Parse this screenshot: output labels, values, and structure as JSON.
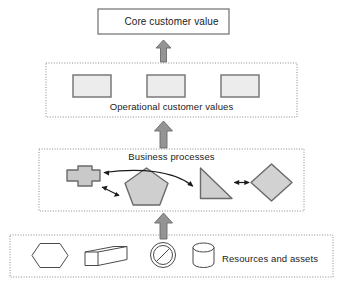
{
  "diagram": {
    "background_color": "#ffffff",
    "text_color": "#1b1b1b",
    "layers": [
      {
        "id": "core",
        "label": "Core customer value",
        "container_style": "solid-rectangle",
        "border_color": "#6e6e6e",
        "fill_color": "#ffffff"
      },
      {
        "id": "operational",
        "label": "Operational customer values",
        "container_style": "dotted-rectangle",
        "border_color": "#8a8a8a",
        "fill_color": "#ffffff"
      },
      {
        "id": "processes",
        "label": "Business processes",
        "container_style": "dotted-rectangle",
        "border_color": "#8a8a8a",
        "fill_color": "#ffffff"
      },
      {
        "id": "resources",
        "label": "Resources and assets",
        "container_style": "dotted-rectangle",
        "border_color": "#8a8a8a",
        "fill_color": "#ffffff"
      }
    ],
    "operational_items": [
      {
        "name": "operational-value-box-1",
        "shape": "rectangle",
        "fill": "#ececec",
        "stroke": "#7a7a7a"
      },
      {
        "name": "operational-value-box-2",
        "shape": "rectangle",
        "fill": "#ececec",
        "stroke": "#7a7a7a"
      },
      {
        "name": "operational-value-box-3",
        "shape": "rectangle",
        "fill": "#ececec",
        "stroke": "#7a7a7a"
      }
    ],
    "process_items": [
      {
        "name": "process-cross-shape",
        "shape": "cross",
        "fill": "#c9c9c9",
        "stroke": "#6a6a6a"
      },
      {
        "name": "process-pentagon-shape",
        "shape": "pentagon",
        "fill": "#cfcfcf",
        "stroke": "#6a6a6a"
      },
      {
        "name": "process-triangle-shape",
        "shape": "right-triangle",
        "fill": "#cfcfcf",
        "stroke": "#6a6a6a"
      },
      {
        "name": "process-diamond-shape",
        "shape": "diamond",
        "fill": "#d2d2d2",
        "stroke": "#6a6a6a"
      }
    ],
    "process_connectors": [
      {
        "name": "connector-cross-pentagon",
        "type": "double-headed-arrow"
      },
      {
        "name": "connector-triangle-to-cross",
        "type": "curved-arrow"
      },
      {
        "name": "connector-triangle-diamond",
        "type": "double-headed-arrow"
      }
    ],
    "resource_items": [
      {
        "name": "resource-hexagon-shape",
        "shape": "hexagon",
        "fill": "#ffffff",
        "stroke": "#4a4a4a"
      },
      {
        "name": "resource-prism-shape",
        "shape": "3d-box",
        "fill": "#ffffff",
        "stroke": "#4a4a4a"
      },
      {
        "name": "resource-prohibition-shape",
        "shape": "no-entry-circle",
        "fill": "#ffffff",
        "stroke": "#4a4a4a"
      },
      {
        "name": "resource-cylinder-shape",
        "shape": "cylinder",
        "fill": "#ffffff",
        "stroke": "#4a4a4a"
      }
    ],
    "flow_arrows": [
      {
        "name": "arrow-processes-to-operational",
        "direction": "up",
        "color": "#8e8e8e"
      },
      {
        "name": "arrow-operational-to-core",
        "direction": "up",
        "color": "#8e8e8e"
      },
      {
        "name": "arrow-resources-to-processes",
        "direction": "up",
        "color": "#8e8e8e"
      }
    ]
  }
}
